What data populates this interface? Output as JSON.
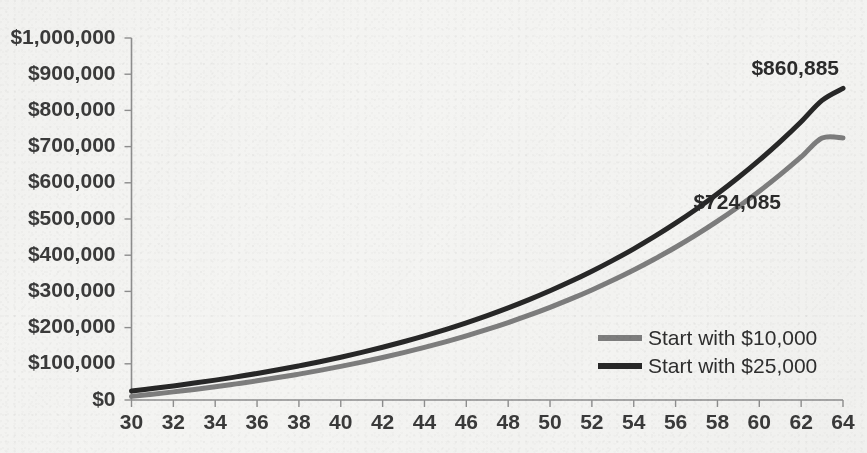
{
  "chart_data": {
    "type": "line",
    "title": "",
    "subtitle": "",
    "xlabel": "",
    "ylabel": "",
    "xlim": [
      30,
      64
    ],
    "ylim": [
      0,
      1000000
    ],
    "grid": false,
    "legend_position": "inside-right-lower",
    "x_tick_labels": [
      "30",
      "32",
      "34",
      "36",
      "38",
      "40",
      "42",
      "44",
      "46",
      "48",
      "50",
      "52",
      "54",
      "56",
      "58",
      "60",
      "62",
      "64"
    ],
    "x_tick_values": [
      30,
      32,
      34,
      36,
      38,
      40,
      42,
      44,
      46,
      48,
      50,
      52,
      54,
      56,
      58,
      60,
      62,
      64
    ],
    "y_tick_labels": [
      "$0",
      "$100,000",
      "$200,000",
      "$300,000",
      "$400,000",
      "$500,000",
      "$600,000",
      "$700,000",
      "$800,000",
      "$900,000",
      "$1,000,000"
    ],
    "y_tick_values": [
      0,
      100000,
      200000,
      300000,
      400000,
      500000,
      600000,
      700000,
      800000,
      900000,
      1000000
    ],
    "x": [
      30,
      31,
      32,
      33,
      34,
      35,
      36,
      37,
      38,
      39,
      40,
      41,
      42,
      43,
      44,
      45,
      46,
      47,
      48,
      49,
      50,
      51,
      52,
      53,
      54,
      55,
      56,
      57,
      58,
      59,
      60,
      61,
      62,
      63,
      64
    ],
    "series": [
      {
        "name": "Start with $10,000",
        "color": "#7d7d7d",
        "line_width": 5,
        "end_label": "$724,085",
        "values": [
          10000,
          16000,
          22420,
          29289,
          36639,
          44504,
          52919,
          61923,
          71558,
          81867,
          92897,
          104700,
          117329,
          130842,
          145301,
          160772,
          177326,
          195039,
          213992,
          234271,
          255970,
          279188,
          304031,
          330613,
          359056,
          389490,
          422055,
          456899,
          494182,
          534075,
          576760,
          622433,
          671304,
          723595,
          724085
        ]
      },
      {
        "name": "Start with $25,000",
        "color": "#272727",
        "line_width": 5,
        "end_label": "$860,885",
        "values": [
          25000,
          31750,
          38963,
          46690,
          54958,
          63805,
          73271,
          83400,
          94238,
          105835,
          118244,
          131521,
          145728,
          160929,
          177194,
          194598,
          213220,
          233145,
          254465,
          277278,
          301687,
          327805,
          355751,
          385654,
          417650,
          451886,
          488518,
          527714,
          569654,
          614530,
          662547,
          713926,
          768901,
          827724,
          860885
        ]
      }
    ],
    "annotations": [
      {
        "name": "top-series-end-value",
        "text": "$860,885",
        "series": "Start with $25,000"
      },
      {
        "name": "bottom-series-end-value",
        "text": "$724,085",
        "series": "Start with $10,000"
      }
    ]
  },
  "legend": {
    "items": [
      {
        "label": "Start with $10,000",
        "color": "#7d7d7d"
      },
      {
        "label": "Start with $25,000",
        "color": "#272727"
      }
    ]
  },
  "colors": {
    "background": "#f4f4f2",
    "axis": "#8e8e8e",
    "text": "#3a3a3a",
    "series_light": "#7d7d7d",
    "series_dark": "#272727"
  }
}
